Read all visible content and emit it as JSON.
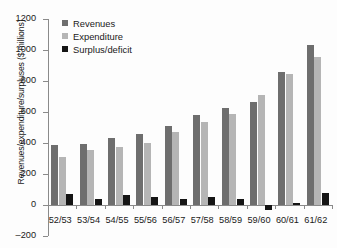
{
  "chart_data": {
    "type": "bar",
    "title": "",
    "xlabel": "",
    "ylabel": "Revenues/expenditure/surpluses ($ millions)",
    "ylim": [
      -200,
      1200
    ],
    "y_ticks": [
      1200,
      1000,
      800,
      600,
      400,
      200,
      0,
      -200
    ],
    "y_tick_labels": [
      "1200",
      "1000",
      "800",
      "600",
      "400",
      "200",
      "0",
      "–200"
    ],
    "grid": false,
    "legend_position": "top-left",
    "categories": [
      "52/53",
      "53/54",
      "54/55",
      "55/56",
      "56/57",
      "57/58",
      "58/59",
      "59/60",
      "60/61",
      "61/62"
    ],
    "series": [
      {
        "name": "Revenues",
        "color": "#6e6e6e",
        "values": [
          385,
          395,
          432,
          455,
          510,
          580,
          628,
          665,
          860,
          1030
        ]
      },
      {
        "name": "Expenditure",
        "color": "#b5b5b5",
        "values": [
          310,
          352,
          372,
          402,
          470,
          535,
          590,
          710,
          845,
          952
        ]
      },
      {
        "name": "Surplus/deficit",
        "color": "#151515",
        "values": [
          72,
          40,
          62,
          52,
          40,
          52,
          38,
          -32,
          15,
          80
        ]
      }
    ]
  }
}
